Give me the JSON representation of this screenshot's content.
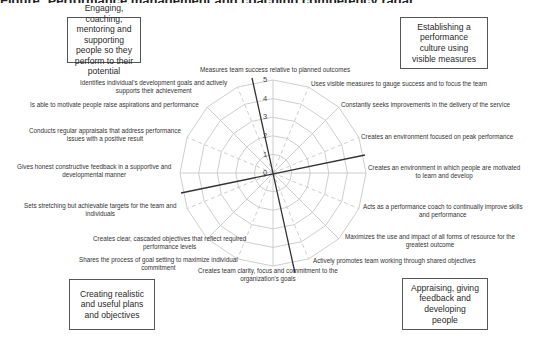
{
  "title": "Figure: Performance management and coaching competency radar",
  "quadrants": [
    {
      "id": "top-left",
      "text": "Engaging, coaching, mentoring and supporting people so they perform to their potential"
    },
    {
      "id": "top-right",
      "text": "Establishing a performance culture using visible measures"
    },
    {
      "id": "bottom-left",
      "text": "Creating realistic and useful plans and objectives"
    },
    {
      "id": "bottom-right",
      "text": "Appraising, giving feedback and developing people"
    }
  ],
  "scale": [
    "0",
    "1",
    "2",
    "3",
    "4",
    "5"
  ],
  "spokes": [
    {
      "label": "Measures team success relative to planned outcomes"
    },
    {
      "label": "Uses visible measures to gauge success and to focus the team"
    },
    {
      "label": "Constantly seeks improvements in the delivery of the service"
    },
    {
      "label": "Creates an environment focused on peak performance"
    },
    {
      "label": "Creates an environment in which people are motivated to learn and develop"
    },
    {
      "label": "Acts as a performance coach to continually improve skills and performance"
    },
    {
      "label": "Maximizes the use and impact of all forms of resource for the greatest outcome"
    },
    {
      "label": "Actively promotes team working through shared objectives"
    },
    {
      "label": "Creates team clarity, focus and commitment to the organization's goals"
    },
    {
      "label": "Shares the process of goal setting to maximize individual commitment"
    },
    {
      "label": "Creates clear, cascaded objectives that reflect required performance levels"
    },
    {
      "label": "Sets stretching but achievable targets for the team and individuals"
    },
    {
      "label": "Gives honest constructive feedback in a supportive and developmental manner"
    },
    {
      "label": "Conducts regular appraisals that address performance issues with a positive result"
    },
    {
      "label": "Is able to motivate people raise aspirations and performance"
    },
    {
      "label": "Identifies individual's development goals and actively supports their achievement"
    }
  ],
  "labels": {
    "s0": "Measures team success relative to planned outcomes",
    "s1": "Uses visible measures to gauge success and to focus the team",
    "s2": "Constantly seeks improvements in the delivery of the service",
    "s3": "Creates an environment focused on peak performance",
    "s4a": "Creates an environment in which people are motivated",
    "s4b": "to learn and develop",
    "s5a": "Acts as a performance coach to continually improve skills",
    "s5b": "and performance",
    "s6a": "Maximizes the use and impact of all forms of resource for the",
    "s6b": "greatest outcome",
    "s7": "Actively promotes team working through shared objectives",
    "s8a": "Creates team clarity, focus and commitment to the",
    "s8b": "organization's goals",
    "s9a": "Shares the process of goal setting to maximize individual",
    "s9b": "commitment",
    "s10a": "Creates clear, cascaded objectives that reflect required",
    "s10b": "performance levels",
    "s11a": "Sets stretching but achievable targets for the team and",
    "s11b": "individuals",
    "s12a": "Gives honest constructive feedback in a supportive and",
    "s12b": "developmental manner",
    "s13a": "Conducts regular appraisals that address performance",
    "s13b": "issues with a positive result",
    "s14": "Is able to motivate people raise aspirations and performance",
    "s15a": "Identifies individual's development goals and actively",
    "s15b": "supports their achievement"
  },
  "colors": {
    "grid": "#c8c8c8",
    "divider": "#333333",
    "box_border": "#555555"
  }
}
